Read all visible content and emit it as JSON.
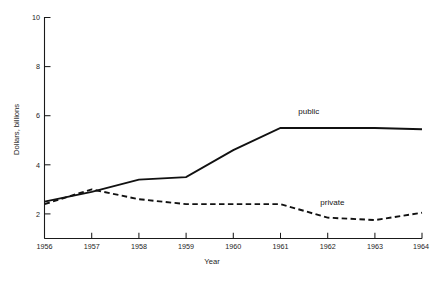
{
  "chart_data": {
    "type": "line",
    "title": "",
    "xlabel": "Year",
    "ylabel": "Dollars, billions",
    "x": [
      1956,
      1957,
      1958,
      1959,
      1960,
      1961,
      1962,
      1963,
      1964
    ],
    "xticklabels": [
      "1956",
      "1957",
      "1958",
      "1959",
      "1960",
      "1961",
      "1962",
      "1963",
      "1964"
    ],
    "yticks": [
      2,
      4,
      6,
      8,
      10
    ],
    "yticklabels": [
      "2",
      "4",
      "6",
      "8",
      "10"
    ],
    "xlim": [
      1956,
      1964
    ],
    "ylim": [
      1,
      10
    ],
    "grid": false,
    "legend_position": "inline-annotations",
    "series": [
      {
        "name": "public",
        "style": "solid",
        "color": "#111111",
        "values": [
          2.5,
          2.9,
          3.4,
          3.5,
          4.6,
          5.5,
          5.5,
          5.5,
          5.45
        ],
        "annotation": "public"
      },
      {
        "name": "private",
        "style": "dashed",
        "color": "#111111",
        "values": [
          2.4,
          3.0,
          2.6,
          2.4,
          2.4,
          2.4,
          1.85,
          1.75,
          2.05
        ],
        "annotation": "private"
      }
    ],
    "annotations": [
      {
        "text": "public",
        "x": 1961.6,
        "y": 6.05
      },
      {
        "text": "private",
        "x": 1962.1,
        "y": 2.35
      }
    ]
  },
  "axes": {
    "y_axis_title": "Dollars, billions",
    "x_axis_title": "Year"
  },
  "footnote": {
    "text": ""
  }
}
